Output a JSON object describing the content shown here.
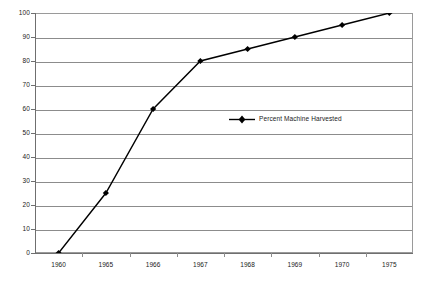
{
  "chart_data": {
    "type": "line",
    "title": "",
    "xlabel": "",
    "ylabel": "",
    "categories": [
      "1960",
      "1965",
      "1966",
      "1967",
      "1968",
      "1969",
      "1970",
      "1975"
    ],
    "series": [
      {
        "name": "Percent Machine Harvested",
        "values": [
          0,
          25,
          60,
          80,
          85,
          90,
          95,
          100
        ],
        "color": "#000000",
        "marker": "diamond"
      }
    ],
    "ylim": [
      0,
      100
    ],
    "ytick_step": 10,
    "ytick_labels": [
      "0",
      "10",
      "20",
      "30",
      "40",
      "50",
      "60",
      "70",
      "80",
      "90",
      "100"
    ],
    "grid": "horizontal",
    "legend_position": "inside-center",
    "plot_border_color": "#9a9a9a",
    "gridline_color": "#8c8c8c",
    "background_color": "#ffffff"
  },
  "legend": {
    "entries": [
      {
        "label": "Percent Machine Harvested",
        "marker": "diamond-marker-icon"
      }
    ]
  }
}
